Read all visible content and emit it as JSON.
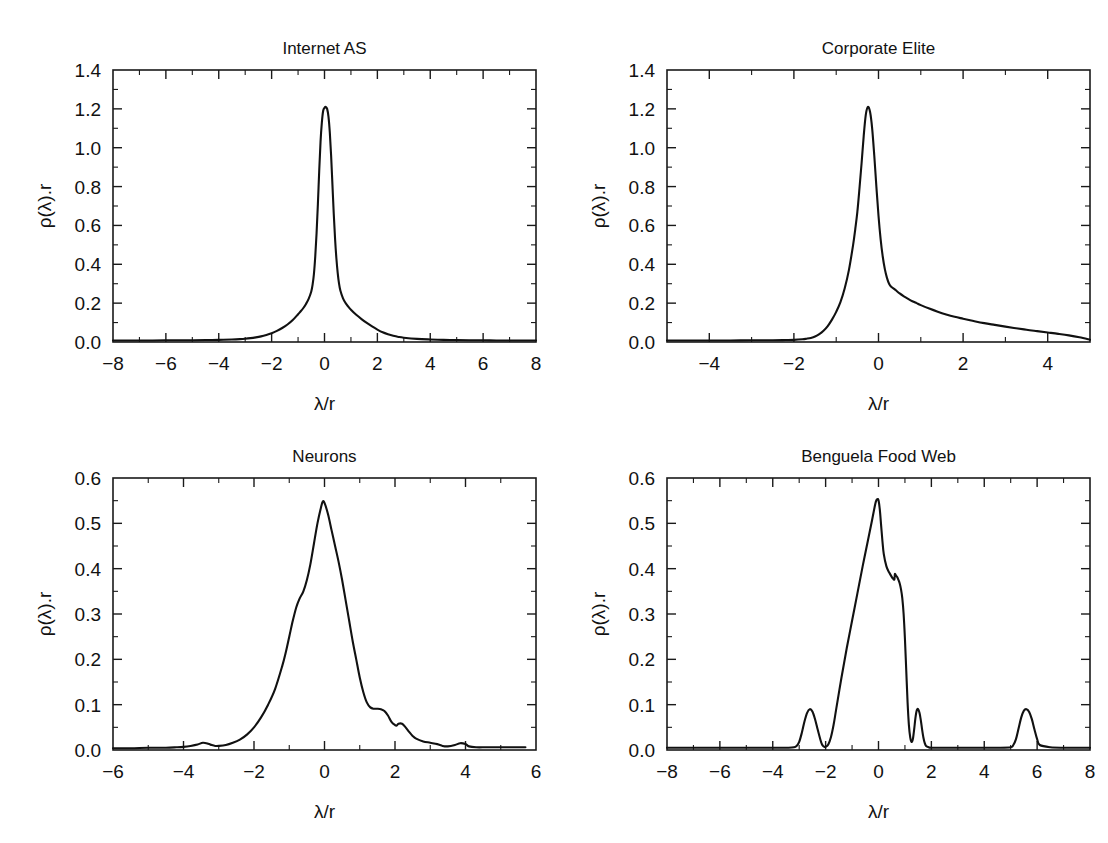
{
  "figure": {
    "title": "",
    "background": "#ffffff",
    "line_color": "#111111",
    "panel_count": 4
  },
  "panels": [
    {
      "id": "internet-as",
      "title": "Internet AS",
      "xlabel": "λ/r",
      "ylabel": "ρ(λ).r"
    },
    {
      "id": "corporate-elite",
      "title": "Corporate Elite",
      "xlabel": "λ/r",
      "ylabel": "ρ(λ).r"
    },
    {
      "id": "neurons",
      "title": "Neurons",
      "xlabel": "λ/r",
      "ylabel": "ρ(λ).r"
    },
    {
      "id": "benguela-food-web",
      "title": "Benguela Food Web",
      "xlabel": "λ/r",
      "ylabel": "ρ(λ).r"
    }
  ],
  "chart_data": [
    {
      "type": "line",
      "id": "internet-as",
      "title": "Internet AS",
      "xlabel": "λ/r",
      "ylabel": "ρ(λ).r",
      "xlim": [
        -8,
        8
      ],
      "ylim": [
        0.0,
        1.4
      ],
      "xticks": [
        -8,
        -6,
        -4,
        -2,
        0,
        2,
        4,
        6,
        8
      ],
      "xtick_labels": [
        "-8",
        "-6",
        "-4",
        "-2",
        "0",
        "2",
        "4",
        "6",
        "8"
      ],
      "xtick_minor_step": 1,
      "yticks": [
        0.0,
        0.2,
        0.4,
        0.6,
        0.8,
        1.0,
        1.2,
        1.4
      ],
      "ytick_labels": [
        "0.0",
        "0.2",
        "0.4",
        "0.6",
        "0.8",
        "1.0",
        "1.2",
        "1.4"
      ],
      "ytick_minor_step": 0.1,
      "grid": false,
      "legend": "none",
      "peak": {
        "x": 0.05,
        "y": 1.21
      },
      "x": [
        -8.0,
        -7.5,
        -7.0,
        -6.5,
        -6.0,
        -5.5,
        -5.0,
        -4.5,
        -4.0,
        -3.5,
        -3.2,
        -3.0,
        -2.8,
        -2.6,
        -2.4,
        -2.2,
        -2.0,
        -1.8,
        -1.6,
        -1.4,
        -1.2,
        -1.0,
        -0.9,
        -0.8,
        -0.7,
        -0.6,
        -0.5,
        -0.45,
        -0.4,
        -0.35,
        -0.3,
        -0.25,
        -0.2,
        -0.15,
        -0.1,
        -0.05,
        0.0,
        0.05,
        0.1,
        0.15,
        0.2,
        0.25,
        0.3,
        0.35,
        0.4,
        0.45,
        0.5,
        0.55,
        0.6,
        0.7,
        0.8,
        0.9,
        1.0,
        1.2,
        1.4,
        1.6,
        1.8,
        2.0,
        2.2,
        2.4,
        2.6,
        2.8,
        3.0,
        3.5,
        4.0,
        4.5,
        5.0,
        5.5,
        6.0,
        6.5,
        7.0,
        7.5,
        8.0
      ],
      "y": [
        0.008,
        0.008,
        0.008,
        0.008,
        0.009,
        0.009,
        0.009,
        0.01,
        0.011,
        0.013,
        0.015,
        0.017,
        0.02,
        0.024,
        0.029,
        0.036,
        0.045,
        0.057,
        0.072,
        0.09,
        0.113,
        0.143,
        0.158,
        0.175,
        0.196,
        0.222,
        0.26,
        0.295,
        0.35,
        0.44,
        0.56,
        0.71,
        0.88,
        1.03,
        1.13,
        1.19,
        1.205,
        1.21,
        1.2,
        1.16,
        1.08,
        0.96,
        0.81,
        0.66,
        0.53,
        0.43,
        0.355,
        0.3,
        0.265,
        0.225,
        0.2,
        0.182,
        0.166,
        0.14,
        0.118,
        0.098,
        0.08,
        0.064,
        0.05,
        0.04,
        0.032,
        0.026,
        0.022,
        0.016,
        0.013,
        0.011,
        0.01,
        0.009,
        0.009,
        0.008,
        0.008,
        0.008,
        0.008
      ]
    },
    {
      "type": "line",
      "id": "corporate-elite",
      "title": "Corporate Elite",
      "xlabel": "λ/r",
      "ylabel": "ρ(λ).r",
      "xlim": [
        -5,
        5
      ],
      "ylim": [
        0.0,
        1.4
      ],
      "xticks": [
        -4,
        -2,
        0,
        2,
        4
      ],
      "xtick_labels": [
        "-4",
        "-2",
        "0",
        "2",
        "4"
      ],
      "xtick_minor_step": 1,
      "yticks": [
        0.0,
        0.2,
        0.4,
        0.6,
        0.8,
        1.0,
        1.2,
        1.4
      ],
      "ytick_labels": [
        "0.0",
        "0.2",
        "0.4",
        "0.6",
        "0.8",
        "1.0",
        "1.2",
        "1.4"
      ],
      "ytick_minor_step": 0.1,
      "grid": false,
      "legend": "none",
      "peak": {
        "x": -0.3,
        "y": 1.21
      },
      "x": [
        -5.0,
        -4.5,
        -4.0,
        -3.5,
        -3.0,
        -2.5,
        -2.2,
        -2.0,
        -1.8,
        -1.7,
        -1.6,
        -1.5,
        -1.4,
        -1.3,
        -1.2,
        -1.1,
        -1.0,
        -0.9,
        -0.8,
        -0.7,
        -0.6,
        -0.55,
        -0.5,
        -0.45,
        -0.4,
        -0.35,
        -0.3,
        -0.25,
        -0.2,
        -0.15,
        -0.1,
        -0.05,
        0.0,
        0.05,
        0.1,
        0.15,
        0.2,
        0.25,
        0.3,
        0.4,
        0.5,
        0.6,
        0.7,
        0.8,
        0.9,
        1.0,
        1.2,
        1.4,
        1.6,
        1.8,
        2.0,
        2.25,
        2.5,
        2.75,
        3.0,
        3.25,
        3.5,
        3.75,
        4.0,
        4.25,
        4.5,
        4.75,
        5.0
      ],
      "y": [
        0.008,
        0.008,
        0.008,
        0.008,
        0.009,
        0.009,
        0.01,
        0.011,
        0.014,
        0.017,
        0.021,
        0.028,
        0.04,
        0.058,
        0.082,
        0.115,
        0.155,
        0.205,
        0.275,
        0.37,
        0.5,
        0.58,
        0.67,
        0.79,
        0.92,
        1.06,
        1.17,
        1.21,
        1.185,
        1.1,
        0.96,
        0.8,
        0.65,
        0.53,
        0.44,
        0.375,
        0.33,
        0.3,
        0.285,
        0.268,
        0.25,
        0.235,
        0.222,
        0.21,
        0.2,
        0.19,
        0.172,
        0.156,
        0.142,
        0.13,
        0.12,
        0.108,
        0.097,
        0.088,
        0.079,
        0.071,
        0.063,
        0.056,
        0.049,
        0.042,
        0.034,
        0.024,
        0.012
      ]
    },
    {
      "type": "line",
      "id": "neurons",
      "title": "Neurons",
      "xlabel": "λ/r",
      "ylabel": "ρ(λ).r",
      "xlim": [
        -6,
        6
      ],
      "ylim": [
        0.0,
        0.6
      ],
      "xticks": [
        -6,
        -4,
        -2,
        0,
        2,
        4,
        6
      ],
      "xtick_labels": [
        "-6",
        "-4",
        "-2",
        "0",
        "2",
        "4",
        "6"
      ],
      "xtick_minor_step": 1,
      "yticks": [
        0.0,
        0.1,
        0.2,
        0.3,
        0.4,
        0.5,
        0.6
      ],
      "ytick_labels": [
        "0.0",
        "0.1",
        "0.2",
        "0.3",
        "0.4",
        "0.5",
        "0.6"
      ],
      "ytick_minor_step": 0.05,
      "grid": false,
      "legend": "none",
      "peak": {
        "x": -0.1,
        "y": 0.55
      },
      "x": [
        -6.0,
        -5.5,
        -5.0,
        -4.5,
        -4.2,
        -4.0,
        -3.8,
        -3.6,
        -3.45,
        -3.3,
        -3.2,
        -3.1,
        -3.0,
        -2.8,
        -2.6,
        -2.4,
        -2.2,
        -2.0,
        -1.8,
        -1.6,
        -1.4,
        -1.2,
        -1.1,
        -1.0,
        -0.9,
        -0.8,
        -0.7,
        -0.6,
        -0.5,
        -0.4,
        -0.3,
        -0.2,
        -0.1,
        -0.05,
        0.0,
        0.1,
        0.2,
        0.3,
        0.4,
        0.5,
        0.6,
        0.7,
        0.8,
        0.9,
        1.0,
        1.1,
        1.2,
        1.3,
        1.4,
        1.5,
        1.6,
        1.7,
        1.8,
        1.9,
        2.0,
        2.05,
        2.1,
        2.2,
        2.3,
        2.4,
        2.5,
        2.6,
        2.8,
        3.0,
        3.2,
        3.35,
        3.5,
        3.7,
        3.85,
        4.0,
        4.1,
        4.3,
        4.6,
        5.0,
        5.4,
        5.7
      ],
      "y": [
        0.004,
        0.004,
        0.005,
        0.005,
        0.006,
        0.007,
        0.009,
        0.012,
        0.016,
        0.014,
        0.011,
        0.009,
        0.009,
        0.011,
        0.016,
        0.023,
        0.034,
        0.05,
        0.072,
        0.1,
        0.135,
        0.185,
        0.215,
        0.25,
        0.285,
        0.315,
        0.335,
        0.35,
        0.375,
        0.41,
        0.455,
        0.5,
        0.535,
        0.548,
        0.545,
        0.52,
        0.485,
        0.45,
        0.415,
        0.375,
        0.33,
        0.285,
        0.24,
        0.2,
        0.16,
        0.128,
        0.105,
        0.094,
        0.091,
        0.091,
        0.09,
        0.086,
        0.076,
        0.062,
        0.055,
        0.054,
        0.058,
        0.058,
        0.05,
        0.04,
        0.031,
        0.025,
        0.019,
        0.016,
        0.013,
        0.009,
        0.008,
        0.011,
        0.015,
        0.013,
        0.008,
        0.006,
        0.006,
        0.006,
        0.006,
        0.006
      ]
    },
    {
      "type": "line",
      "id": "benguela-food-web",
      "title": "Benguela Food Web",
      "xlabel": "λ/r",
      "ylabel": "ρ(λ).r",
      "xlim": [
        -8,
        8
      ],
      "ylim": [
        0.0,
        0.6
      ],
      "xticks": [
        -8,
        -6,
        -4,
        -2,
        0,
        2,
        4,
        6,
        8
      ],
      "xtick_labels": [
        "-8",
        "-6",
        "-4",
        "-2",
        "0",
        "2",
        "4",
        "6",
        "8"
      ],
      "xtick_minor_step": 1,
      "yticks": [
        0.0,
        0.1,
        0.2,
        0.3,
        0.4,
        0.5,
        0.6
      ],
      "ytick_labels": [
        "0.0",
        "0.1",
        "0.2",
        "0.3",
        "0.4",
        "0.5",
        "0.6"
      ],
      "ytick_minor_step": 0.05,
      "grid": false,
      "legend": "none",
      "peak": {
        "x": -0.05,
        "y": 0.55
      },
      "satellite_peaks": [
        {
          "x": -2.6,
          "y": 0.09
        },
        {
          "x": 1.45,
          "y": 0.09
        },
        {
          "x": 5.6,
          "y": 0.09
        }
      ],
      "x": [
        -8.0,
        -7.0,
        -6.0,
        -5.0,
        -4.0,
        -3.4,
        -3.2,
        -3.1,
        -3.0,
        -2.9,
        -2.8,
        -2.7,
        -2.6,
        -2.5,
        -2.4,
        -2.3,
        -2.2,
        -2.15,
        -2.1,
        -2.05,
        -2.0,
        -1.9,
        -1.8,
        -1.7,
        -1.6,
        -1.4,
        -1.2,
        -1.0,
        -0.8,
        -0.6,
        -0.4,
        -0.25,
        -0.15,
        -0.1,
        -0.05,
        0.0,
        0.05,
        0.1,
        0.15,
        0.2,
        0.3,
        0.4,
        0.5,
        0.55,
        0.6,
        0.62,
        0.65,
        0.7,
        0.75,
        0.8,
        0.85,
        0.9,
        0.95,
        1.0,
        1.05,
        1.1,
        1.15,
        1.2,
        1.25,
        1.3,
        1.35,
        1.4,
        1.45,
        1.5,
        1.55,
        1.6,
        1.65,
        1.7,
        1.75,
        1.8,
        1.9,
        2.0,
        2.5,
        3.0,
        3.5,
        4.0,
        4.5,
        5.0,
        5.1,
        5.2,
        5.3,
        5.4,
        5.5,
        5.6,
        5.7,
        5.8,
        5.9,
        6.0,
        6.1,
        6.5,
        7.0,
        7.5,
        8.0
      ],
      "y": [
        0.005,
        0.005,
        0.005,
        0.005,
        0.005,
        0.005,
        0.006,
        0.009,
        0.018,
        0.038,
        0.063,
        0.082,
        0.09,
        0.085,
        0.068,
        0.045,
        0.023,
        0.014,
        0.009,
        0.007,
        0.007,
        0.012,
        0.028,
        0.055,
        0.09,
        0.16,
        0.225,
        0.285,
        0.345,
        0.405,
        0.462,
        0.505,
        0.535,
        0.548,
        0.553,
        0.551,
        0.53,
        0.495,
        0.46,
        0.432,
        0.405,
        0.392,
        0.382,
        0.378,
        0.376,
        0.388,
        0.386,
        0.382,
        0.376,
        0.368,
        0.355,
        0.335,
        0.3,
        0.245,
        0.175,
        0.105,
        0.055,
        0.028,
        0.018,
        0.024,
        0.046,
        0.072,
        0.088,
        0.09,
        0.082,
        0.066,
        0.045,
        0.027,
        0.015,
        0.009,
        0.006,
        0.005,
        0.005,
        0.005,
        0.005,
        0.005,
        0.005,
        0.006,
        0.011,
        0.024,
        0.048,
        0.072,
        0.087,
        0.09,
        0.084,
        0.068,
        0.045,
        0.024,
        0.011,
        0.006,
        0.005,
        0.005,
        0.005
      ]
    }
  ]
}
